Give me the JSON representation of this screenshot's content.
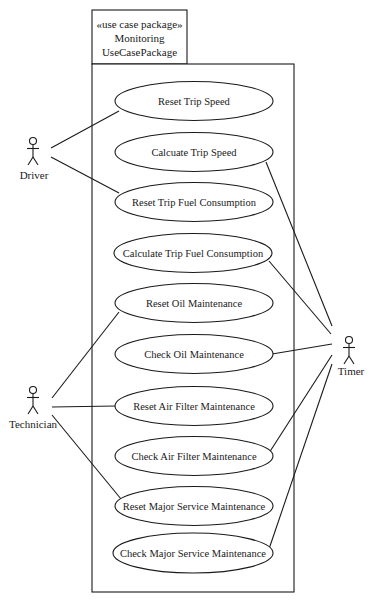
{
  "package": {
    "stereotype": "«use case package»",
    "name_line1": "Monitoring",
    "name_line2": "UseCasePackage"
  },
  "actors": [
    {
      "id": "driver",
      "label": "Driver"
    },
    {
      "id": "technician",
      "label": "Technician"
    },
    {
      "id": "timer",
      "label": "Timer"
    }
  ],
  "use_cases": [
    {
      "id": "uc1",
      "label": "Reset Trip Speed"
    },
    {
      "id": "uc2",
      "label": "Calcuate Trip Speed"
    },
    {
      "id": "uc3",
      "label": "Reset Trip Fuel Consumption"
    },
    {
      "id": "uc4",
      "label": "Calculate Trip Fuel Consumption"
    },
    {
      "id": "uc5",
      "label": "Reset Oil Maintenance"
    },
    {
      "id": "uc6",
      "label": "Check Oil Maintenance"
    },
    {
      "id": "uc7",
      "label": "Reset Air Filter Maintenance"
    },
    {
      "id": "uc8",
      "label": "Check Air Filter Maintenance"
    },
    {
      "id": "uc9",
      "label": "Reset Major Service Maintenance"
    },
    {
      "id": "uc10",
      "label": "Check Major Service Maintenance"
    }
  ],
  "associations": [
    {
      "actor": "Driver",
      "use_case": "Reset Trip Speed"
    },
    {
      "actor": "Driver",
      "use_case": "Reset Trip Fuel Consumption"
    },
    {
      "actor": "Technician",
      "use_case": "Reset Oil Maintenance"
    },
    {
      "actor": "Technician",
      "use_case": "Reset Air Filter Maintenance"
    },
    {
      "actor": "Technician",
      "use_case": "Reset Major Service Maintenance"
    },
    {
      "actor": "Timer",
      "use_case": "Calcuate Trip Speed"
    },
    {
      "actor": "Timer",
      "use_case": "Calculate Trip Fuel Consumption"
    },
    {
      "actor": "Timer",
      "use_case": "Check Oil Maintenance"
    },
    {
      "actor": "Timer",
      "use_case": "Check Air Filter Maintenance"
    },
    {
      "actor": "Timer",
      "use_case": "Check Major Service Maintenance"
    }
  ]
}
